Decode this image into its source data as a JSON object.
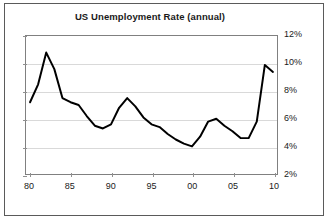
{
  "chart_data": {
    "type": "line",
    "title": "US Unemployment Rate (annual)",
    "xlabel": "",
    "ylabel": "",
    "grid": true,
    "legend": false,
    "xlim": [
      1979.5,
      2010.5
    ],
    "ylim": [
      2,
      12
    ],
    "ytick_labels": [
      "12%",
      "10%",
      "8%",
      "6%",
      "4%",
      "2%"
    ],
    "ytick_values": [
      12,
      10,
      8,
      6,
      4,
      2
    ],
    "xtick_labels": [
      "80",
      "85",
      "90",
      "95",
      "00",
      "05",
      "10"
    ],
    "xtick_values": [
      1980,
      1985,
      1990,
      1995,
      2000,
      2005,
      2010
    ],
    "x": [
      1980,
      1981,
      1982,
      1983,
      1984,
      1985,
      1986,
      1987,
      1988,
      1989,
      1990,
      1991,
      1992,
      1993,
      1994,
      1995,
      1996,
      1997,
      1998,
      1999,
      2000,
      2001,
      2002,
      2003,
      2004,
      2005,
      2006,
      2007,
      2008,
      2009,
      2010
    ],
    "values": [
      7.2,
      8.5,
      10.8,
      9.6,
      7.5,
      7.2,
      7.0,
      6.2,
      5.5,
      5.3,
      5.6,
      6.8,
      7.5,
      6.9,
      6.1,
      5.6,
      5.4,
      4.9,
      4.5,
      4.2,
      4.0,
      4.7,
      5.8,
      6.0,
      5.5,
      5.1,
      4.6,
      4.6,
      5.8,
      9.9,
      9.4
    ],
    "series": [
      {
        "name": "US Unemployment Rate",
        "color": "#000000",
        "values": [
          7.2,
          8.5,
          10.8,
          9.6,
          7.5,
          7.2,
          7.0,
          6.2,
          5.5,
          5.3,
          5.6,
          6.8,
          7.5,
          6.9,
          6.1,
          5.6,
          5.4,
          4.9,
          4.5,
          4.2,
          4.0,
          4.7,
          5.8,
          6.0,
          5.5,
          5.1,
          4.6,
          4.6,
          5.8,
          9.9,
          9.4
        ]
      }
    ]
  }
}
